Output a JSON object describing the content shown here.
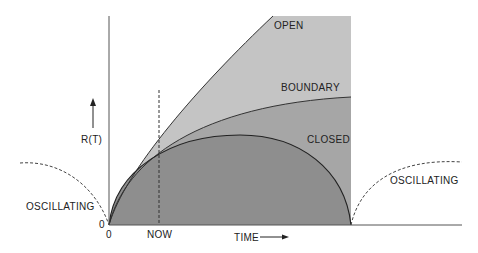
{
  "diagram": {
    "y_axis_label": "R(T)",
    "x_axis_label": "TIME",
    "origin_y_label": "0",
    "origin_x_label": "0",
    "now_label": "NOW",
    "regions": {
      "open": "OPEN",
      "boundary": "BOUNDARY",
      "closed": "CLOSED",
      "oscillating_left": "OSCILLATING",
      "oscillating_right": "OSCILLATING"
    },
    "colors": {
      "open_fill": "#c4c4c4",
      "boundary_fill": "#a6a6a6",
      "closed_fill": "#8e8e8e",
      "line": "#333333"
    }
  }
}
